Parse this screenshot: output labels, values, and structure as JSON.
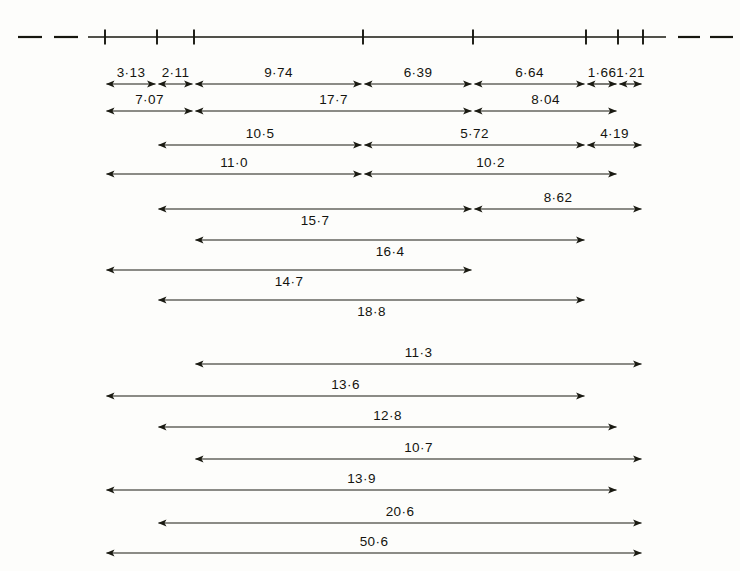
{
  "figure": {
    "kind": "dimension-diagram",
    "background_color": "#fdfdfb",
    "ink_color": "#17170f"
  },
  "axis": {
    "name": "horizontal-scale-axis",
    "y": 37,
    "solid_start_x": 88,
    "solid_end_x": 666,
    "tick_height": 15,
    "ticks_x": [
      105,
      157,
      194,
      363,
      473,
      586,
      618,
      643
    ],
    "left_dashes": [
      {
        "x1": 18,
        "x2": 42
      },
      {
        "x1": 54,
        "x2": 78
      }
    ],
    "right_dashes": [
      {
        "x1": 678,
        "x2": 700
      },
      {
        "x1": 710,
        "x2": 733
      }
    ]
  },
  "chart_data": {
    "type": "table",
    "title": "",
    "xlabel": "",
    "ylabel": "",
    "rows": [
      {
        "row": 1,
        "y": 84,
        "segments": [
          {
            "label": "3·13",
            "x1": 105,
            "x2": 157,
            "label_pos": "above"
          },
          {
            "label": "2·11",
            "x1": 157,
            "x2": 194,
            "label_pos": "above"
          },
          {
            "label": "9·74",
            "x1": 194,
            "x2": 363,
            "label_pos": "above"
          },
          {
            "label": "6·39",
            "x1": 363,
            "x2": 473,
            "label_pos": "above"
          },
          {
            "label": "6·64",
            "x1": 473,
            "x2": 586,
            "label_pos": "above"
          },
          {
            "label": "1·66",
            "x1": 586,
            "x2": 618,
            "label_pos": "above"
          },
          {
            "label": "1·21",
            "x1": 618,
            "x2": 643,
            "label_pos": "above"
          }
        ]
      },
      {
        "row": 2,
        "y": 111,
        "segments": [
          {
            "label": "7·07",
            "x1": 105,
            "x2": 194,
            "label_pos": "above"
          },
          {
            "label": "17·7",
            "x1": 194,
            "x2": 473,
            "label_pos": "above"
          },
          {
            "label": "8·04",
            "x1": 473,
            "x2": 618,
            "label_pos": "above"
          }
        ]
      },
      {
        "row": 3,
        "y": 145,
        "segments": [
          {
            "label": "10·5",
            "x1": 157,
            "x2": 363,
            "label_pos": "above"
          },
          {
            "label": "5·72",
            "x1": 363,
            "x2": 586,
            "label_pos": "above"
          },
          {
            "label": "4·19",
            "x1": 586,
            "x2": 643,
            "label_pos": "above"
          }
        ]
      },
      {
        "row": 4,
        "y": 174,
        "segments": [
          {
            "label": "11·0",
            "x1": 105,
            "x2": 363,
            "label_pos": "above"
          },
          {
            "label": "10·2",
            "x1": 363,
            "x2": 618,
            "label_pos": "above"
          }
        ]
      },
      {
        "row": 5,
        "y": 209,
        "segments": [
          {
            "label": "15·7",
            "x1": 157,
            "x2": 473,
            "label_pos": "below"
          },
          {
            "label": "8·62",
            "x1": 473,
            "x2": 643,
            "label_pos": "above"
          }
        ]
      },
      {
        "row": 6,
        "y": 240,
        "segments": [
          {
            "label": "16·4",
            "x1": 194,
            "x2": 586,
            "label_pos": "below"
          }
        ]
      },
      {
        "row": 7,
        "y": 270,
        "segments": [
          {
            "label": "14·7",
            "x1": 105,
            "x2": 473,
            "label_pos": "below"
          }
        ]
      },
      {
        "row": 8,
        "y": 300,
        "segments": [
          {
            "label": "18·8",
            "x1": 157,
            "x2": 586,
            "label_pos": "below"
          }
        ]
      },
      {
        "row": 9,
        "y": 364,
        "segments": [
          {
            "label": "11·3",
            "x1": 194,
            "x2": 643,
            "label_pos": "above"
          }
        ]
      },
      {
        "row": 10,
        "y": 396,
        "segments": [
          {
            "label": "13·6",
            "x1": 105,
            "x2": 586,
            "label_pos": "above"
          }
        ]
      },
      {
        "row": 11,
        "y": 427,
        "segments": [
          {
            "label": "12·8",
            "x1": 157,
            "x2": 618,
            "label_pos": "above"
          }
        ]
      },
      {
        "row": 12,
        "y": 459,
        "segments": [
          {
            "label": "10·7",
            "x1": 194,
            "x2": 643,
            "label_pos": "above"
          }
        ]
      },
      {
        "row": 13,
        "y": 490,
        "segments": [
          {
            "label": "13·9",
            "x1": 105,
            "x2": 618,
            "label_pos": "above"
          }
        ]
      },
      {
        "row": 14,
        "y": 523,
        "segments": [
          {
            "label": "20·6",
            "x1": 157,
            "x2": 643,
            "label_pos": "above"
          }
        ]
      },
      {
        "row": 15,
        "y": 553,
        "segments": [
          {
            "label": "50·6",
            "x1": 105,
            "x2": 643,
            "label_pos": "above"
          }
        ]
      }
    ]
  }
}
